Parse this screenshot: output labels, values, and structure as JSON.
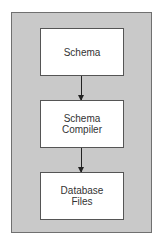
{
  "diagram": {
    "nodes": [
      {
        "id": "schema",
        "label": "Schema"
      },
      {
        "id": "schema-compiler",
        "label": "Schema\nCompiler"
      },
      {
        "id": "database-files",
        "label": "Database\nFiles"
      }
    ],
    "edges": [
      {
        "from": "schema",
        "to": "schema-compiler"
      },
      {
        "from": "schema-compiler",
        "to": "database-files"
      }
    ],
    "colors": {
      "frame_bg": "#c9c9c9",
      "box_bg": "#ffffff",
      "arrow": "#222222"
    }
  }
}
